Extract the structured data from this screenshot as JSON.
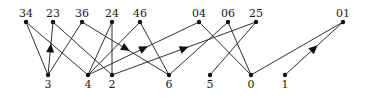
{
  "diagram": {
    "type": "directed-graph",
    "colors": {
      "line": "#1a1a1a",
      "dot": "#111111",
      "background": "#ffffff"
    },
    "top_nodes": [
      {
        "id": "34",
        "label": "34",
        "x": 26,
        "y": 22
      },
      {
        "id": "23",
        "label": "23",
        "x": 53,
        "y": 22
      },
      {
        "id": "36",
        "label": "36",
        "x": 82,
        "y": 22
      },
      {
        "id": "24",
        "label": "24",
        "x": 112,
        "y": 22
      },
      {
        "id": "46",
        "label": "46",
        "x": 140,
        "y": 22
      },
      {
        "id": "04",
        "label": "04",
        "x": 199,
        "y": 22
      },
      {
        "id": "06",
        "label": "06",
        "x": 228,
        "y": 22
      },
      {
        "id": "25",
        "label": "25",
        "x": 256,
        "y": 22
      },
      {
        "id": "01",
        "label": "01",
        "x": 343,
        "y": 22
      }
    ],
    "bottom_nodes": [
      {
        "id": "3",
        "label": "3",
        "x": 48,
        "y": 75
      },
      {
        "id": "4",
        "label": "4",
        "x": 88,
        "y": 75
      },
      {
        "id": "2",
        "label": "2",
        "x": 112,
        "y": 75
      },
      {
        "id": "6",
        "label": "6",
        "x": 169,
        "y": 75
      },
      {
        "id": "5",
        "label": "5",
        "x": 210,
        "y": 75
      },
      {
        "id": "0",
        "label": "0",
        "x": 251,
        "y": 75
      },
      {
        "id": "1",
        "label": "1",
        "x": 285,
        "y": 75
      }
    ],
    "edges": [
      {
        "from": "34",
        "to": "3",
        "arrow": false
      },
      {
        "from": "34",
        "to": "4",
        "arrow": false
      },
      {
        "from": "3",
        "to": "23",
        "arrow": true
      },
      {
        "from": "23",
        "to": "2",
        "arrow": false
      },
      {
        "from": "36",
        "to": "3",
        "arrow": false
      },
      {
        "from": "36",
        "to": "6",
        "arrow": true
      },
      {
        "from": "24",
        "to": "4",
        "arrow": false
      },
      {
        "from": "24",
        "to": "2",
        "arrow": false
      },
      {
        "from": "46",
        "to": "4",
        "arrow": false
      },
      {
        "from": "46",
        "to": "6",
        "arrow": false
      },
      {
        "from": "4",
        "to": "04",
        "arrow": true
      },
      {
        "from": "2",
        "to": "25",
        "arrow": true
      },
      {
        "from": "04",
        "to": "0",
        "arrow": false
      },
      {
        "from": "06",
        "to": "6",
        "arrow": false
      },
      {
        "from": "06",
        "to": "0",
        "arrow": false
      },
      {
        "from": "25",
        "to": "5",
        "arrow": false
      },
      {
        "from": "0",
        "to": "01",
        "arrow": false
      },
      {
        "from": "1",
        "to": "01",
        "arrow": true
      }
    ]
  }
}
